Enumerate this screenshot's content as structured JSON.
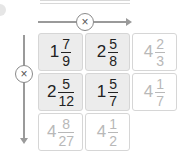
{
  "operator": {
    "symbol": "×",
    "name": "multiply"
  },
  "grid": {
    "rows": [
      [
        {
          "whole": "1",
          "num": "7",
          "den": "9",
          "kind": "given"
        },
        {
          "whole": "2",
          "num": "5",
          "den": "8",
          "kind": "given"
        },
        {
          "whole": "4",
          "num": "2",
          "den": "3",
          "kind": "answer"
        }
      ],
      [
        {
          "whole": "2",
          "num": "5",
          "den": "12",
          "kind": "given"
        },
        {
          "whole": "1",
          "num": "5",
          "den": "7",
          "kind": "given"
        },
        {
          "whole": "4",
          "num": "1",
          "den": "7",
          "kind": "answer"
        }
      ],
      [
        {
          "whole": "4",
          "num": "8",
          "den": "27",
          "kind": "answer"
        },
        {
          "whole": "4",
          "num": "1",
          "den": "2",
          "kind": "answer"
        },
        null
      ]
    ]
  }
}
